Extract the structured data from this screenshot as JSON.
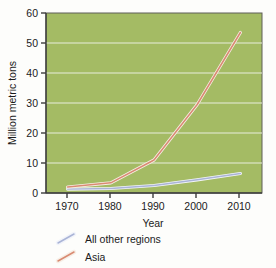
{
  "chart_data": {
    "type": "line",
    "title": "",
    "subtitle": "",
    "xlabel": "Year",
    "ylabel": "Million metric tons",
    "x": [
      1970,
      1980,
      1990,
      2000,
      2010
    ],
    "xlim": [
      1965,
      2015
    ],
    "ylim": [
      0,
      60
    ],
    "xticks": [
      "1970",
      "1980",
      "1990",
      "2000",
      "2010"
    ],
    "yticks": [
      "0",
      "10",
      "20",
      "30",
      "40",
      "50",
      "60"
    ],
    "grid": "horizontal",
    "legend_position": "below-axes-left",
    "plot_background": "#a4bb64",
    "gridline_color": "#e8eedc",
    "series": [
      {
        "name": "All other regions",
        "color": "#aab4d6",
        "values": [
          1.3,
          1.5,
          2.5,
          4.4,
          6.5
        ]
      },
      {
        "name": "Asia",
        "color": "#d98b72",
        "values": [
          2.0,
          3.4,
          11.0,
          29.5,
          53.5
        ]
      }
    ]
  },
  "axes": {
    "y_axis_title": "Million metric tons",
    "x_axis_title": "Year",
    "y_tick_labels": [
      "60",
      "50",
      "40",
      "30",
      "20",
      "10",
      "0"
    ],
    "x_tick_labels": [
      "1970",
      "1980",
      "1990",
      "2000",
      "2010"
    ]
  },
  "legend": {
    "entries": [
      {
        "label": "All other regions",
        "color": "#aab4d6"
      },
      {
        "label": "Asia",
        "color": "#d98b72"
      }
    ]
  },
  "colors": {
    "plot_background": "#a4bb64",
    "page_background": "#fdfdfb",
    "axis_line": "#4a4a4a",
    "gridline": "#e8eedc",
    "series_all_other_regions": "#aab4d6",
    "series_asia": "#d98b72",
    "text": "#1b1b1b"
  }
}
